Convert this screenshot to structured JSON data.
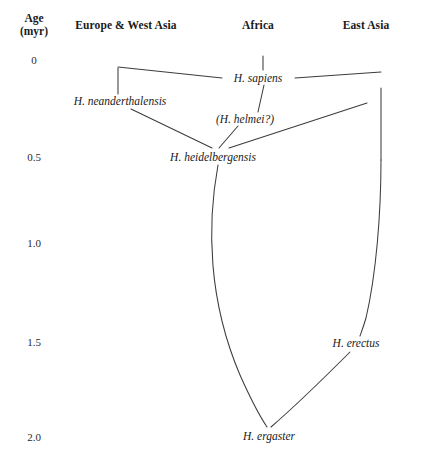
{
  "figure": {
    "background_color": "#ffffff",
    "line_color": "#3c3c3c"
  },
  "axis": {
    "title_line1": "Age",
    "title_line2": "(myr)",
    "title_x": 34,
    "ticks": [
      {
        "label": "0",
        "value": 0,
        "x": 34,
        "y": 60
      },
      {
        "label": "0.5",
        "value": 0.5,
        "x": 34,
        "y": 157
      },
      {
        "label": "1.0",
        "value": 1.0,
        "x": 34,
        "y": 243
      },
      {
        "label": "1.5",
        "value": 1.5,
        "x": 34,
        "y": 342
      },
      {
        "label": "2.0",
        "value": 2.0,
        "x": 34,
        "y": 437
      }
    ]
  },
  "columns": [
    {
      "label": "Europe & West Asia",
      "x": 126,
      "y": 19
    },
    {
      "label": "Africa",
      "x": 258,
      "y": 19
    },
    {
      "label": "East Asia",
      "x": 366,
      "y": 19
    }
  ],
  "taxa": [
    {
      "name": "H. sapiens",
      "x": 258,
      "y": 78,
      "region": "Africa",
      "age": 0.0
    },
    {
      "name": "H. neanderthalensis",
      "x": 120,
      "y": 101,
      "region": "Europe & West Asia",
      "age": 0.15
    },
    {
      "name": "(H. helmei?)",
      "x": 245,
      "y": 119,
      "region": "Africa",
      "age": 0.25
    },
    {
      "name": "H. heidelbergensis",
      "x": 213,
      "y": 157,
      "region": "Africa",
      "age": 0.5
    },
    {
      "name": "H. erectus",
      "x": 356,
      "y": 343,
      "region": "East Asia",
      "age": 1.5
    },
    {
      "name": "H. ergaster",
      "x": 269,
      "y": 436,
      "region": "Africa",
      "age": 2.0
    }
  ],
  "branches": [
    {
      "id": "sapiens-stem-tick",
      "from": "H. sapiens",
      "to": "top"
    },
    {
      "id": "sapiens-to-westasia-top",
      "from": "H. sapiens",
      "to": "Europe & West Asia crown"
    },
    {
      "id": "neanderthal-vertical",
      "from": "Europe & West Asia crown",
      "to": "H. neanderthalensis"
    },
    {
      "id": "sapiens-to-eastasia-top",
      "from": "H. sapiens",
      "to": "East Asia crown"
    },
    {
      "id": "helmei-to-sapiens",
      "from": "(H. helmei?)",
      "to": "H. sapiens"
    },
    {
      "id": "heidelbergensis-to-helmei",
      "from": "H. heidelbergensis",
      "to": "(H. helmei?)"
    },
    {
      "id": "neanderthal-to-heidelbergensis",
      "from": "H. neanderthalensis",
      "to": "H. heidelbergensis"
    },
    {
      "id": "heidelbergensis-to-eastasia",
      "from": "H. heidelbergensis",
      "to": "East Asia lineage"
    },
    {
      "id": "heidelbergensis-to-ergaster",
      "from": "H. heidelbergensis",
      "to": "H. ergaster"
    },
    {
      "id": "eastasia-to-erectus",
      "from": "East Asia crown",
      "to": "H. erectus"
    },
    {
      "id": "erectus-to-ergaster",
      "from": "H. erectus",
      "to": "H. ergaster"
    }
  ]
}
